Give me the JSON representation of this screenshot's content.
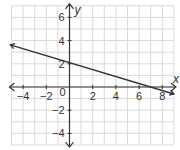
{
  "chart_data": {
    "type": "line",
    "title": "",
    "xlabel": "x",
    "ylabel": "y",
    "xlim": [
      -5,
      9
    ],
    "ylim": [
      -5,
      7
    ],
    "grid": true,
    "x_ticks": [
      -4,
      -2,
      0,
      2,
      4,
      6,
      8
    ],
    "y_ticks": [
      -4,
      -2,
      2,
      4,
      6
    ],
    "x_tick_labels": [
      "−4",
      "−2",
      "2",
      "4",
      "6",
      "8"
    ],
    "y_tick_labels": [
      "−4",
      "−2",
      "2",
      "4",
      "6"
    ],
    "origin_label": "0",
    "series": [
      {
        "name": "line",
        "kind": "linear",
        "slope": -0.3,
        "intercept": 2.1,
        "x_range": [
          -5.1,
          9
        ],
        "arrows": "both",
        "color": "#333333"
      }
    ]
  },
  "colors": {
    "grid": "#d9d9d9",
    "axis": "#333333",
    "line": "#333333"
  }
}
